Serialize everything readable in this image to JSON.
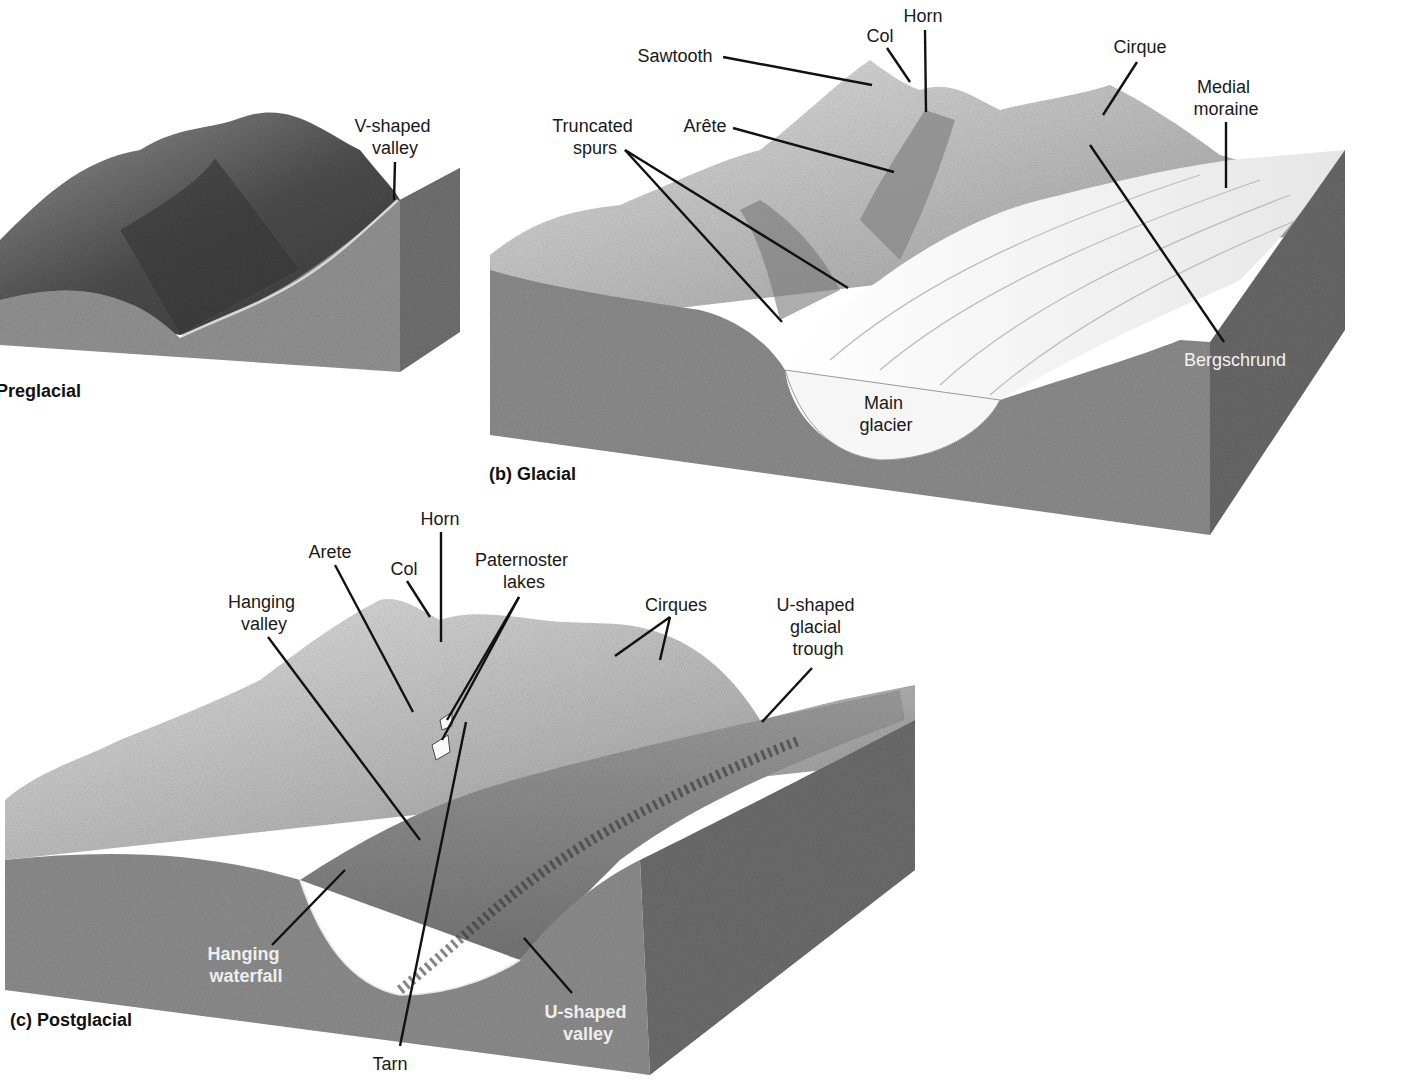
{
  "figure": {
    "panels": [
      {
        "id": "a",
        "caption": "Preglacial",
        "labels": [
          {
            "text": [
              "V-shaped",
              "valley"
            ],
            "x": 395,
            "y": 132
          }
        ]
      },
      {
        "id": "b",
        "caption": "(b) Glacial",
        "labels": [
          {
            "key": "sawtooth",
            "text": [
              "Sawtooth"
            ],
            "x": 675,
            "y": 62
          },
          {
            "key": "col",
            "text": [
              "Col"
            ],
            "x": 880,
            "y": 42
          },
          {
            "key": "horn",
            "text": [
              "Horn"
            ],
            "x": 923,
            "y": 22
          },
          {
            "key": "cirque",
            "text": [
              "Cirque"
            ],
            "x": 1140,
            "y": 53
          },
          {
            "key": "medial_moraine",
            "text": [
              "Medial",
              "moraine"
            ],
            "x": 1226,
            "y": 93
          },
          {
            "key": "truncated_spurs",
            "text": [
              "Truncated",
              "spurs"
            ],
            "x": 595,
            "y": 132
          },
          {
            "key": "arete",
            "text": [
              "Arête"
            ],
            "x": 705,
            "y": 132
          },
          {
            "key": "bergschrund",
            "text": [
              "Bergschrund"
            ],
            "x": 1235,
            "y": 366
          },
          {
            "key": "main_glacier",
            "text": [
              "Main",
              "glacier"
            ],
            "x": 886,
            "y": 409
          }
        ]
      },
      {
        "id": "c",
        "caption": "(c) Postglacial",
        "labels": [
          {
            "key": "horn",
            "text": [
              "Horn"
            ],
            "x": 440,
            "y": 525
          },
          {
            "key": "arete",
            "text": [
              "Arete"
            ],
            "x": 330,
            "y": 558
          },
          {
            "key": "col",
            "text": [
              "Col"
            ],
            "x": 404,
            "y": 575
          },
          {
            "key": "paternoster_lakes",
            "text": [
              "Paternoster",
              "lakes"
            ],
            "x": 524,
            "y": 566
          },
          {
            "key": "hanging_valley",
            "text": [
              "Hanging",
              "valley"
            ],
            "x": 264,
            "y": 608
          },
          {
            "key": "cirques",
            "text": [
              "Cirques"
            ],
            "x": 676,
            "y": 611
          },
          {
            "key": "u_shaped_glacial_trough",
            "text": [
              "U-shaped",
              "glacial",
              "trough"
            ],
            "x": 818,
            "y": 611
          },
          {
            "key": "hanging_waterfall",
            "text": [
              "Hanging",
              "waterfall"
            ],
            "x": 246,
            "y": 960
          },
          {
            "key": "u_shaped_valley",
            "text": [
              "U-shaped",
              "valley"
            ],
            "x": 588,
            "y": 1018
          },
          {
            "key": "tarn",
            "text": [
              "Tarn"
            ],
            "x": 390,
            "y": 1070
          }
        ]
      }
    ]
  },
  "colors": {
    "background": "#ffffff",
    "rock_front": "#8c8c8c",
    "rock_side": "#6e6e6e",
    "terrain_dark": "#5a5a5a",
    "ice": "#f3f3f3",
    "text": "#1a1a1a"
  }
}
